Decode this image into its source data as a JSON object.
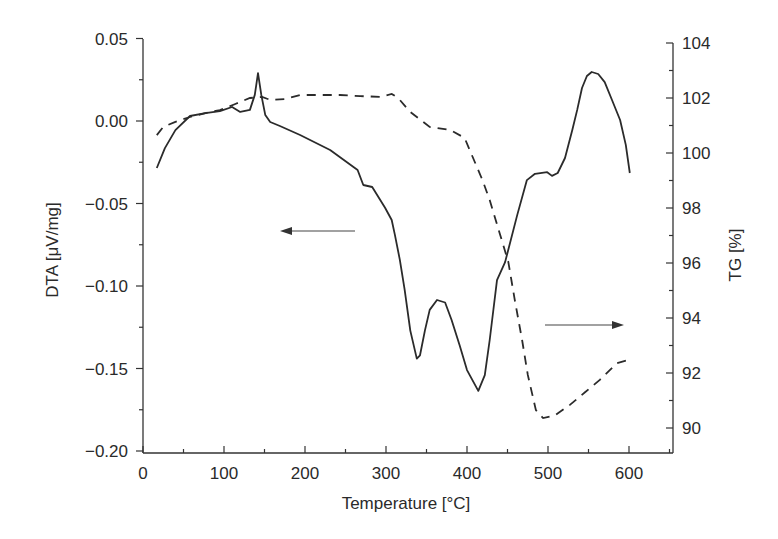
{
  "chart_data": {
    "type": "line",
    "title": "",
    "xlabel": "Temperature [°C]",
    "ylabel": "DTA [μV/mg]",
    "ylabel_right": "TG [%]",
    "xlim": [
      0,
      650
    ],
    "ylim": [
      -0.2,
      0.05
    ],
    "ylim_right": [
      89.2,
      104
    ],
    "grid": false,
    "legend": "none (arrows indicate axis: left arrow → DTA, right arrow → TG)",
    "x_ticks": [
      "0",
      "100",
      "200",
      "300",
      "400",
      "500",
      "600"
    ],
    "y_ticks": [
      "0.05",
      "0.00",
      "-0.05",
      "-0.10",
      "-0.15",
      "-0.20"
    ],
    "y_ticks_right": [
      "104",
      "102",
      "100",
      "98",
      "96",
      "94",
      "92",
      "90"
    ],
    "series": [
      {
        "name": "DTA",
        "axis": "left",
        "style": "solid",
        "x": [
          17,
          27,
          40,
          58,
          77,
          95,
          110,
          120,
          132,
          138,
          142,
          146,
          151,
          157,
          169,
          194,
          231,
          265,
          272,
          283,
          299,
          307,
          311,
          317,
          323,
          330,
          338,
          342,
          348,
          354,
          363,
          373,
          381,
          391,
          400,
          414,
          422,
          428,
          437,
          447,
          462,
          474,
          484,
          499,
          505,
          512,
          521,
          530,
          536,
          542,
          548,
          554,
          562,
          570,
          579,
          589,
          596,
          601
        ],
        "values": [
          -0.0285,
          -0.0164,
          -0.0055,
          0.003,
          0.0048,
          0.006,
          0.0085,
          0.0055,
          0.0067,
          0.0158,
          0.029,
          0.0158,
          0.0036,
          -0.0006,
          -0.003,
          -0.0085,
          -0.0176,
          -0.0297,
          -0.0388,
          -0.04,
          -0.0527,
          -0.06,
          -0.069,
          -0.084,
          -0.102,
          -0.127,
          -0.144,
          -0.142,
          -0.127,
          -0.1145,
          -0.1085,
          -0.11,
          -0.1206,
          -0.136,
          -0.151,
          -0.1636,
          -0.154,
          -0.1327,
          -0.0964,
          -0.0855,
          -0.057,
          -0.0358,
          -0.032,
          -0.031,
          -0.0333,
          -0.0315,
          -0.0224,
          -0.0055,
          0.0067,
          0.02,
          0.0273,
          0.0297,
          0.0285,
          0.0236,
          0.0127,
          0.0006,
          -0.0145,
          -0.0315
        ]
      },
      {
        "name": "TG",
        "axis": "right",
        "style": "dashed",
        "x": [
          17,
          25,
          40,
          58,
          77,
          95,
          114,
          132,
          147,
          157,
          175,
          194,
          219,
          243,
          268,
          293,
          307,
          315,
          330,
          354,
          379,
          397,
          419,
          428,
          441,
          451,
          459,
          468,
          475,
          485,
          494,
          509,
          527,
          546,
          564,
          585,
          599
        ],
        "values": [
          100.65,
          100.95,
          101.13,
          101.31,
          101.45,
          101.56,
          101.78,
          102.0,
          102.04,
          101.93,
          101.96,
          102.11,
          102.11,
          102.11,
          102.07,
          102.04,
          102.15,
          102.0,
          101.49,
          100.95,
          100.84,
          100.55,
          99.02,
          98.29,
          97.02,
          96.04,
          94.65,
          93.2,
          91.93,
          90.65,
          90.36,
          90.47,
          90.84,
          91.31,
          91.75,
          92.36,
          92.47
        ]
      }
    ],
    "annotations": [
      {
        "type": "arrow",
        "direction": "left",
        "from": [
          275,
          -0.066
        ],
        "to": [
          170,
          -0.066
        ],
        "meaning": "solid curve uses left axis (DTA)"
      },
      {
        "type": "arrow",
        "direction": "right",
        "from": [
          497,
          93.8
        ],
        "to": [
          596,
          93.8
        ],
        "meaning": "dashed curve uses right axis (TG)"
      }
    ]
  }
}
